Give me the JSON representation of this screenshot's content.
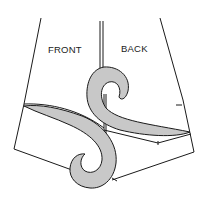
{
  "figure": {
    "labels": {
      "front": "FRONT",
      "back": "BACK"
    },
    "colors": {
      "line": "#1a1a1a",
      "curve_fill": "#c8c8c8",
      "background": "#ffffff"
    }
  }
}
